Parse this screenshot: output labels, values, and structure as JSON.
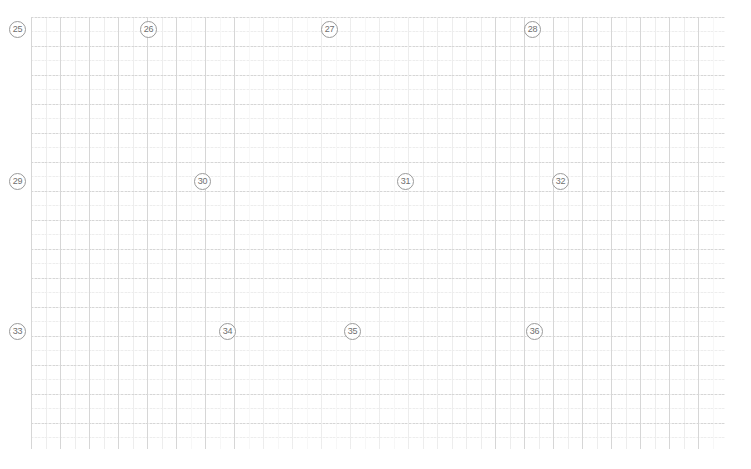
{
  "page": {
    "width": 751,
    "height": 469,
    "background_color": "#ffffff"
  },
  "grid": {
    "origin_x": 31,
    "origin_y": 17,
    "width": 694,
    "height": 432,
    "major_cell_px": 29,
    "minor_cell_px": 14.5,
    "major_line_color": "#d6d6d6",
    "minor_line_color": "#ededed"
  },
  "markers": {
    "circle_border_color": "#9a9a9a",
    "text_color": "#6f6f6f",
    "items": [
      {
        "label": "25",
        "x": 9,
        "y": 21
      },
      {
        "label": "26",
        "x": 140,
        "y": 21
      },
      {
        "label": "27",
        "x": 321,
        "y": 21
      },
      {
        "label": "28",
        "x": 524,
        "y": 21
      },
      {
        "label": "29",
        "x": 9,
        "y": 173
      },
      {
        "label": "30",
        "x": 194,
        "y": 173
      },
      {
        "label": "31",
        "x": 397,
        "y": 173
      },
      {
        "label": "32",
        "x": 552,
        "y": 173
      },
      {
        "label": "33",
        "x": 9,
        "y": 323
      },
      {
        "label": "34",
        "x": 219,
        "y": 323
      },
      {
        "label": "35",
        "x": 344,
        "y": 323
      },
      {
        "label": "36",
        "x": 526,
        "y": 323
      }
    ]
  }
}
